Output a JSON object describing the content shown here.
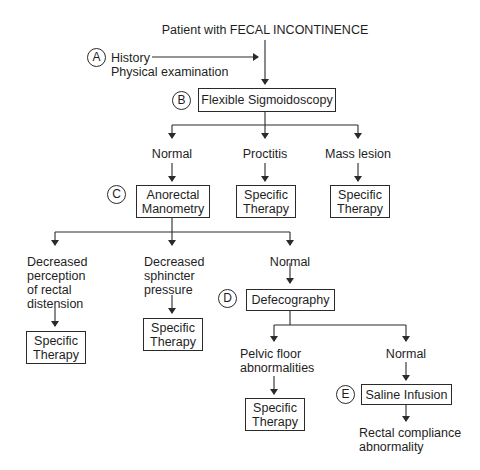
{
  "diagram": {
    "title": "Patient with FECAL INCONTINENCE",
    "steps": {
      "A": {
        "marker": "A",
        "line1": "History",
        "line2": "Physical examination"
      },
      "B": {
        "marker": "B",
        "label": "Flexible Sigmoidoscopy"
      },
      "C": {
        "marker": "C",
        "line1": "Anorectal",
        "line2": "Manometry"
      },
      "D": {
        "marker": "D",
        "label": "Defecography"
      },
      "E": {
        "marker": "E",
        "label": "Saline Infusion"
      }
    },
    "sigmoidoscopy_outcomes": [
      {
        "label": "Normal"
      },
      {
        "label": "Proctitis",
        "result_line1": "Specific",
        "result_line2": "Therapy"
      },
      {
        "label": "Mass lesion",
        "result_line1": "Specific",
        "result_line2": "Therapy"
      }
    ],
    "manometry_outcomes": [
      {
        "lines": [
          "Decreased",
          "perception",
          "of rectal",
          "distension"
        ],
        "result_line1": "Specific",
        "result_line2": "Therapy"
      },
      {
        "lines": [
          "Decreased",
          "sphincter",
          "pressure"
        ],
        "result_line1": "Specific",
        "result_line2": "Therapy"
      },
      {
        "lines": [
          "Normal"
        ]
      }
    ],
    "defecography_outcomes": [
      {
        "lines": [
          "Pelvic floor",
          "abnormalities"
        ],
        "result_line1": "Specific",
        "result_line2": "Therapy"
      },
      {
        "lines": [
          "Normal"
        ]
      }
    ],
    "saline_outcome": {
      "lines": [
        "Rectal compliance",
        "abnormality"
      ]
    }
  }
}
